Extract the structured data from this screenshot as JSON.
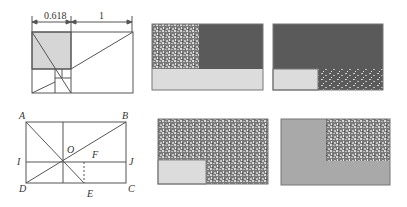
{
  "figure": {
    "golden_diagram": {
      "dimension_labels": {
        "short": "0.618",
        "long": "1"
      }
    },
    "point_diagram": {
      "points": {
        "A": "A",
        "B": "B",
        "C": "C",
        "D": "D",
        "E": "E",
        "F": "F",
        "I": "I",
        "J": "J",
        "O": "O"
      }
    },
    "panels": [
      {
        "id": "top-middle",
        "description": "textured square top-left, dark right, light strip bottom"
      },
      {
        "id": "top-right",
        "description": "dark field, light box bottom-left, speckled strip bottom-right"
      },
      {
        "id": "bottom-middle",
        "description": "textured field, light box bottom-left"
      },
      {
        "id": "bottom-right",
        "description": "grey field, textured box top-right"
      }
    ],
    "colors": {
      "line": "#555555",
      "light_fill": "#dcdcdc",
      "dark_fill": "#5a5a5a",
      "grey_fill": "#a9a9a9",
      "shade": "#d6d6d6"
    }
  }
}
